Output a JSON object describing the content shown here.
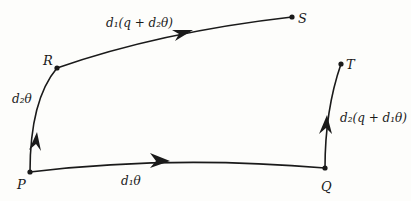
{
  "diagram": {
    "points": [
      {
        "id": "P",
        "label": "P",
        "x": 30,
        "y": 172
      },
      {
        "id": "Q",
        "label": "Q",
        "x": 325,
        "y": 168
      },
      {
        "id": "R",
        "label": "R",
        "x": 57,
        "y": 68
      },
      {
        "id": "S",
        "label": "S",
        "x": 292,
        "y": 17
      },
      {
        "id": "T",
        "label": "T",
        "x": 341,
        "y": 64
      }
    ],
    "edges": [
      {
        "from": "P",
        "to": "Q",
        "label": "d₁θ"
      },
      {
        "from": "P",
        "to": "R",
        "label": "d₂θ"
      },
      {
        "from": "R",
        "to": "S",
        "label": "d₁(q + d₂θ)"
      },
      {
        "from": "Q",
        "to": "T",
        "label": "d₂(q + d₁θ)"
      }
    ],
    "colors": {
      "stroke": "#1a1a1a",
      "background": "#fdfdfb"
    }
  }
}
